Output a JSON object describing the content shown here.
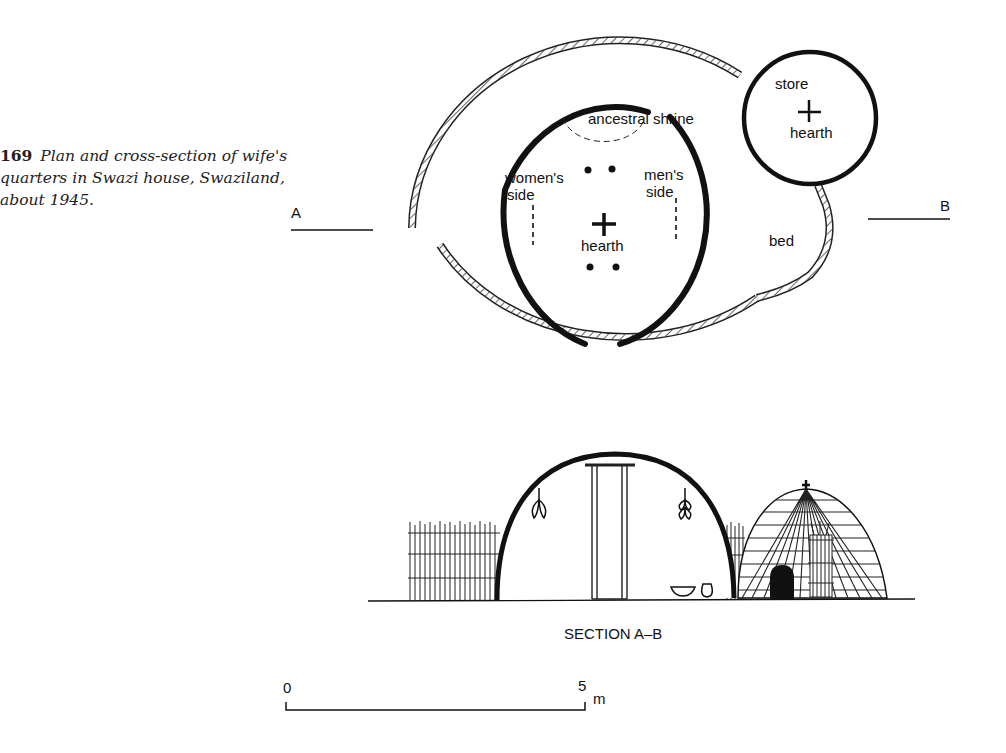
{
  "caption": {
    "number": "169",
    "text": "Plan and cross-section of wife's quarters in Swazi house, Swaziland, about 1945."
  },
  "plan": {
    "section_marker_a": "A",
    "section_marker_b": "B",
    "labels": {
      "ancestral_shrine": "ancestral shrine",
      "womens_side_1": "women's",
      "womens_side_2": "side",
      "mens_side_1": "men's",
      "mens_side_2": "side",
      "hearth_main": "hearth",
      "store": "store",
      "hearth_store": "hearth",
      "bed": "bed"
    }
  },
  "section": {
    "title": "SECTION A–B"
  },
  "scale_bar": {
    "start": "0",
    "end": "5",
    "unit": "m"
  }
}
